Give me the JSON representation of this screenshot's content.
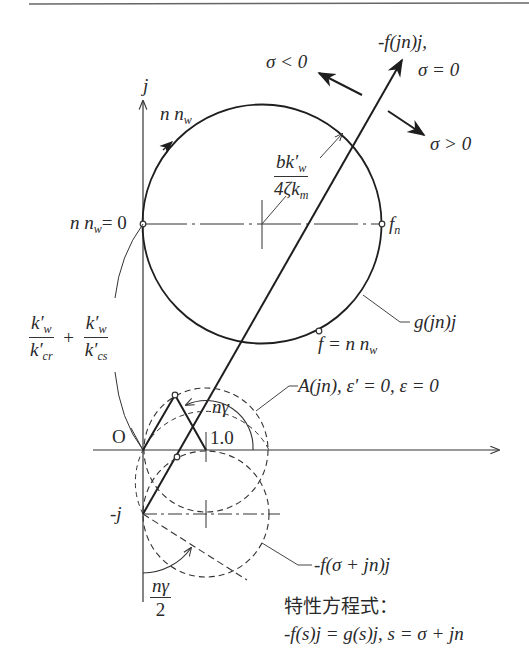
{
  "figure": {
    "type": "complex-plane locus diagram",
    "axes": {
      "imaginary_axis_label": "j",
      "origin_label": "O",
      "unit_tick_label": "1.0",
      "negative_j_label": "-j"
    },
    "labels": {
      "f_locus_title_line1": "-f(jn)j,",
      "f_locus_title_line2": "σ = 0",
      "sigma_negative": "σ < 0",
      "sigma_positive": "σ > 0",
      "nnw_direction": "n n",
      "nnw_direction_sub": "w",
      "radius_num": "bk′",
      "radius_num_sub": "w",
      "radius_den": "4ζk",
      "radius_den_sub": "m",
      "nnw_zero": "n n",
      "nnw_zero_sub": "w",
      "nnw_zero_eq": "= 0",
      "fn_label": "f",
      "fn_sub": "n",
      "g_locus": "g(jn)j",
      "f_eq_nnw": "f = n n",
      "f_eq_nnw_sub": "w",
      "left_frac1_num": "k′",
      "left_frac1_num_sub": "w",
      "left_frac1_den": "k′",
      "left_frac1_den_sub": "cr",
      "left_plus": "+",
      "left_frac2_num": "k′",
      "left_frac2_num_sub": "w",
      "left_frac2_den": "k′",
      "left_frac2_den_sub": "cs",
      "A_locus": "A(jn),  ε′ = 0,  ε = 0",
      "n_gamma": "nγ",
      "f_sigma_locus": "-f(σ + jn)j",
      "half_angle_num": "nγ",
      "half_angle_den": "2",
      "char_eq_title": "特性方程式：",
      "char_eq": "-f(s)j = g(s)j,   s = σ + jn"
    },
    "colors": {
      "line": "#1e1e1e",
      "thin": "#444444",
      "text": "#2a2a2a"
    }
  }
}
